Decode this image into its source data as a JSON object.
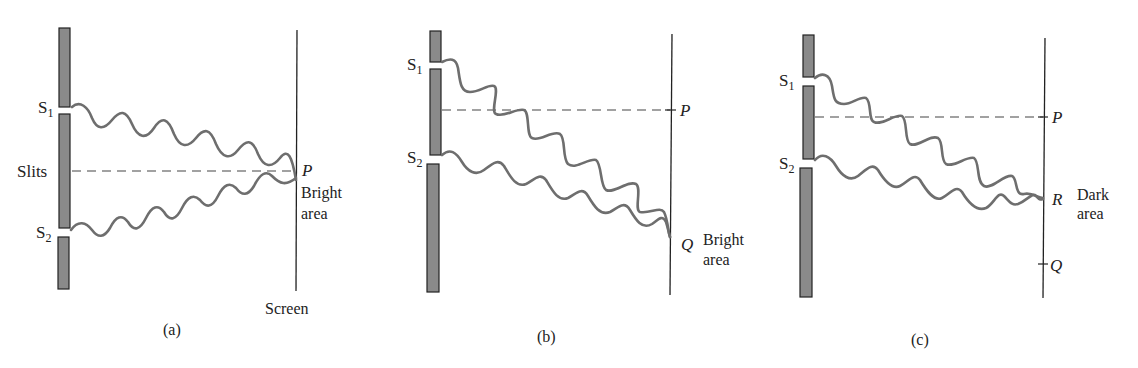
{
  "figure": {
    "panels": [
      {
        "id": "a",
        "caption": "(a)",
        "slit_labels": {
          "s1": "S",
          "s1_sub": "1",
          "s2": "S",
          "s2_sub": "2"
        },
        "barrier_label": "Slits",
        "screen_label": "Screen",
        "point_labels": {
          "p": "P"
        },
        "region_label": {
          "line1": "Bright",
          "line2": "area"
        }
      },
      {
        "id": "b",
        "caption": "(b)",
        "slit_labels": {
          "s1": "S",
          "s1_sub": "1",
          "s2": "S",
          "s2_sub": "2"
        },
        "point_labels": {
          "p": "P",
          "q": "Q"
        },
        "region_label": {
          "line1": "Bright",
          "line2": "area"
        }
      },
      {
        "id": "c",
        "caption": "(c)",
        "slit_labels": {
          "s1": "S",
          "s1_sub": "1",
          "s2": "S",
          "s2_sub": "2"
        },
        "point_labels": {
          "p": "P",
          "r": "R",
          "q": "Q"
        },
        "region_label": {
          "line1": "Dark",
          "line2": "area"
        }
      }
    ],
    "colors": {
      "barrier_fill": "#8a8a8a",
      "wave_stroke": "#6e6e6e",
      "line": "#222222"
    }
  }
}
